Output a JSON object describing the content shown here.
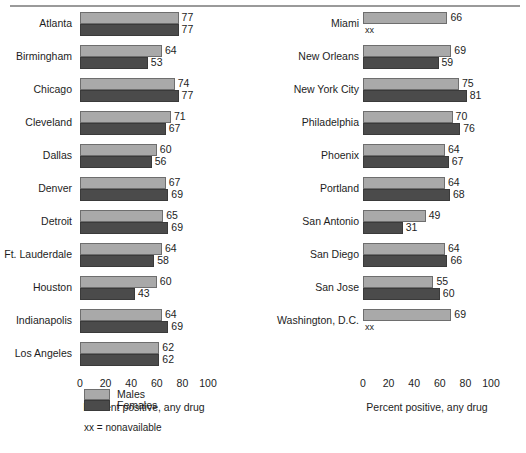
{
  "chart_data": {
    "type": "bar",
    "orientation": "horizontal",
    "title": "",
    "xlabel": "Percent positive, any drug",
    "ylabel": "",
    "xlim": [
      0,
      100
    ],
    "ticks": [
      "0",
      "20",
      "40",
      "60",
      "80",
      "100"
    ],
    "grid": false,
    "legend": {
      "position": "bottom-left",
      "entries": [
        {
          "name": "Males",
          "color": "#a9a9a9"
        },
        {
          "name": "Females",
          "color": "#4b4b4b"
        }
      ],
      "note": "xx = nonavailable"
    },
    "series": [
      {
        "name": "Males"
      },
      {
        "name": "Females"
      }
    ],
    "panels": [
      {
        "id": "left",
        "xlabel": "Percent positive, any drug",
        "categories": [
          "Atlanta",
          "Birmingham",
          "Chicago",
          "Cleveland",
          "Dallas",
          "Denver",
          "Detroit",
          "Ft. Lauderdale",
          "Houston",
          "Indianapolis",
          "Los Angeles"
        ],
        "rows": [
          {
            "city": "Atlanta",
            "male": 77,
            "female": 77,
            "male_label": "77",
            "female_label": "77"
          },
          {
            "city": "Birmingham",
            "male": 64,
            "female": 53,
            "male_label": "64",
            "female_label": "53"
          },
          {
            "city": "Chicago",
            "male": 74,
            "female": 77,
            "male_label": "74",
            "female_label": "77"
          },
          {
            "city": "Cleveland",
            "male": 71,
            "female": 67,
            "male_label": "71",
            "female_label": "67"
          },
          {
            "city": "Dallas",
            "male": 60,
            "female": 56,
            "male_label": "60",
            "female_label": "56"
          },
          {
            "city": "Denver",
            "male": 67,
            "female": 69,
            "male_label": "67",
            "female_label": "69"
          },
          {
            "city": "Detroit",
            "male": 65,
            "female": 69,
            "male_label": "65",
            "female_label": "69"
          },
          {
            "city": "Ft. Lauderdale",
            "male": 64,
            "female": 58,
            "male_label": "64",
            "female_label": "58"
          },
          {
            "city": "Houston",
            "male": 60,
            "female": 43,
            "male_label": "60",
            "female_label": "43"
          },
          {
            "city": "Indianapolis",
            "male": 64,
            "female": 69,
            "male_label": "64",
            "female_label": "69"
          },
          {
            "city": "Los Angeles",
            "male": 62,
            "female": 62,
            "male_label": "62",
            "female_label": "62"
          }
        ]
      },
      {
        "id": "right",
        "xlabel": "Percent positive, any drug",
        "categories": [
          "Miami",
          "New Orleans",
          "New York City",
          "Philadelphia",
          "Phoenix",
          "Portland",
          "San Antonio",
          "San Diego",
          "San Jose",
          "Washington, D.C."
        ],
        "rows": [
          {
            "city": "Miami",
            "male": 66,
            "female": null,
            "male_label": "66",
            "female_label": "xx"
          },
          {
            "city": "New Orleans",
            "male": 69,
            "female": 59,
            "male_label": "69",
            "female_label": "59"
          },
          {
            "city": "New York City",
            "male": 75,
            "female": 81,
            "male_label": "75",
            "female_label": "81"
          },
          {
            "city": "Philadelphia",
            "male": 70,
            "female": 76,
            "male_label": "70",
            "female_label": "76"
          },
          {
            "city": "Phoenix",
            "male": 64,
            "female": 67,
            "male_label": "64",
            "female_label": "67"
          },
          {
            "city": "Portland",
            "male": 64,
            "female": 68,
            "male_label": "64",
            "female_label": "68"
          },
          {
            "city": "San Antonio",
            "male": 49,
            "female": 31,
            "male_label": "49",
            "female_label": "31"
          },
          {
            "city": "San Diego",
            "male": 64,
            "female": 66,
            "male_label": "64",
            "female_label": "66"
          },
          {
            "city": "San Jose",
            "male": 55,
            "female": 60,
            "male_label": "55",
            "female_label": "60"
          },
          {
            "city": "Washington, D.C.",
            "male": 69,
            "female": null,
            "male_label": "69",
            "female_label": "xx"
          }
        ]
      }
    ]
  }
}
